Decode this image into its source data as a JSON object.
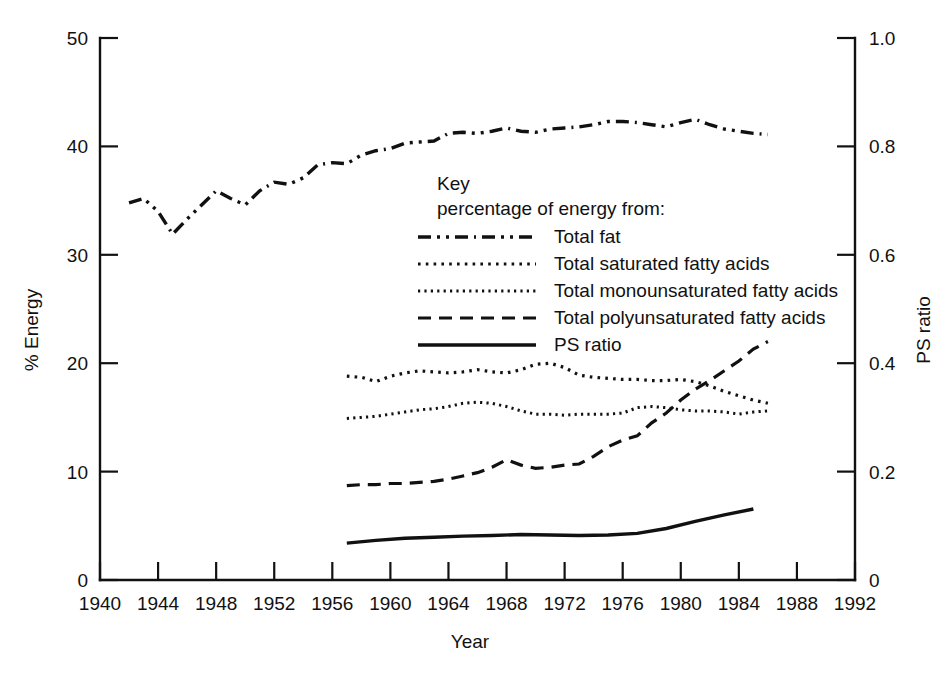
{
  "chart_data": {
    "type": "line",
    "title": "",
    "xlabel": "Year",
    "ylabel": "% Energy",
    "y2label": "PS ratio",
    "xlim": [
      1940,
      1992
    ],
    "ylim": [
      0,
      50
    ],
    "y2lim": [
      0,
      1.0
    ],
    "xticks": [
      1940,
      1944,
      1948,
      1952,
      1956,
      1960,
      1964,
      1968,
      1972,
      1976,
      1980,
      1984,
      1988,
      1992
    ],
    "xtick_labels": [
      "1940",
      "1944",
      "1948",
      "1952",
      "1956",
      "1960",
      "1964",
      "1968",
      "1972",
      "1976",
      "1980",
      "1984",
      "1988",
      "1992"
    ],
    "yticks": [
      0,
      10,
      20,
      30,
      40,
      50
    ],
    "ytick_labels": [
      "0",
      "10",
      "20",
      "30",
      "40",
      "50"
    ],
    "y2ticks": [
      0,
      0.2,
      0.4,
      0.6,
      0.8,
      1.0
    ],
    "y2tick_labels": [
      "0",
      "0.2",
      "0.4",
      "0.6",
      "0.8",
      "1.0"
    ],
    "grid": false,
    "legend_position": "center",
    "legend_title": "Key",
    "legend_subtitle": "percentage of energy from:",
    "series": [
      {
        "name": "Total fat",
        "axis": "left",
        "dash": "dashdotdot",
        "x": [
          1942,
          1943,
          1944,
          1945,
          1946,
          1947,
          1948,
          1949,
          1950,
          1951,
          1952,
          1953,
          1954,
          1955,
          1956,
          1957,
          1958,
          1959,
          1960,
          1961,
          1962,
          1963,
          1964,
          1965,
          1966,
          1967,
          1968,
          1969,
          1970,
          1971,
          1972,
          1973,
          1974,
          1975,
          1976,
          1977,
          1978,
          1979,
          1980,
          1981,
          1982,
          1983,
          1984,
          1985,
          1986
        ],
        "y": [
          34.8,
          35.2,
          34.0,
          31.9,
          33.3,
          34.6,
          35.9,
          35.2,
          34.6,
          35.9,
          36.7,
          36.5,
          37.1,
          38.3,
          38.5,
          38.4,
          39.2,
          39.6,
          39.8,
          40.3,
          40.4,
          40.5,
          41.2,
          41.3,
          41.2,
          41.4,
          41.7,
          41.4,
          41.3,
          41.6,
          41.7,
          41.8,
          42.0,
          42.3,
          42.3,
          42.2,
          42.0,
          41.8,
          42.2,
          42.5,
          42.0,
          41.6,
          41.4,
          41.2,
          41.1
        ]
      },
      {
        "name": "Total saturated fatty acids",
        "axis": "left",
        "dash": "dotted",
        "x": [
          1957,
          1958,
          1959,
          1960,
          1961,
          1962,
          1963,
          1964,
          1965,
          1966,
          1967,
          1968,
          1969,
          1970,
          1971,
          1972,
          1973,
          1974,
          1975,
          1976,
          1977,
          1978,
          1979,
          1980,
          1981,
          1982,
          1983,
          1984,
          1985,
          1986
        ],
        "y": [
          18.8,
          18.7,
          18.3,
          18.8,
          19.1,
          19.3,
          19.2,
          19.1,
          19.2,
          19.4,
          19.2,
          19.1,
          19.4,
          19.9,
          20.0,
          19.6,
          18.9,
          18.7,
          18.6,
          18.5,
          18.5,
          18.4,
          18.4,
          18.5,
          18.3,
          17.9,
          17.4,
          17.0,
          16.6,
          16.3
        ]
      },
      {
        "name": "Total monounsaturated fatty acids",
        "axis": "left",
        "dash": "fine-dotted",
        "x": [
          1957,
          1958,
          1959,
          1960,
          1961,
          1962,
          1963,
          1964,
          1965,
          1966,
          1967,
          1968,
          1969,
          1970,
          1971,
          1972,
          1973,
          1974,
          1975,
          1976,
          1977,
          1978,
          1979,
          1980,
          1981,
          1982,
          1983,
          1984,
          1985,
          1986
        ],
        "y": [
          14.9,
          15.0,
          15.1,
          15.3,
          15.5,
          15.7,
          15.8,
          16.0,
          16.3,
          16.4,
          16.3,
          16.0,
          15.6,
          15.3,
          15.3,
          15.2,
          15.3,
          15.3,
          15.3,
          15.4,
          15.9,
          16.0,
          15.9,
          15.7,
          15.6,
          15.6,
          15.5,
          15.3,
          15.5,
          15.6
        ]
      },
      {
        "name": "Total polyunsaturated fatty acids",
        "axis": "left",
        "dash": "dashed",
        "x": [
          1957,
          1958,
          1959,
          1960,
          1961,
          1962,
          1963,
          1964,
          1965,
          1966,
          1967,
          1968,
          1969,
          1970,
          1971,
          1972,
          1973,
          1974,
          1975,
          1976,
          1977,
          1978,
          1979,
          1980,
          1981,
          1982,
          1983,
          1984,
          1985,
          1986
        ],
        "y": [
          8.7,
          8.8,
          8.8,
          8.9,
          8.9,
          9.0,
          9.1,
          9.3,
          9.6,
          9.9,
          10.4,
          11.1,
          10.6,
          10.3,
          10.4,
          10.6,
          10.7,
          11.4,
          12.3,
          12.9,
          13.3,
          14.5,
          15.4,
          16.6,
          17.6,
          18.4,
          19.3,
          20.2,
          21.3,
          22.0
        ]
      },
      {
        "name": "PS ratio",
        "axis": "right",
        "dash": "solid",
        "x": [
          1957,
          1959,
          1961,
          1963,
          1965,
          1967,
          1969,
          1971,
          1973,
          1975,
          1977,
          1979,
          1981,
          1983,
          1985
        ],
        "y": [
          0.068,
          0.073,
          0.077,
          0.079,
          0.081,
          0.082,
          0.084,
          0.083,
          0.082,
          0.083,
          0.086,
          0.095,
          0.108,
          0.12,
          0.131
        ]
      }
    ]
  },
  "legend": {
    "title": "Key",
    "subtitle": "percentage of energy from:",
    "entries": [
      {
        "label": "Total fat",
        "dash": "dashdotdot"
      },
      {
        "label": "Total saturated fatty acids",
        "dash": "dotted"
      },
      {
        "label": "Total monounsaturated fatty acids",
        "dash": "fine-dotted"
      },
      {
        "label": "Total polyunsaturated fatty acids",
        "dash": "dashed"
      },
      {
        "label": "PS ratio",
        "dash": "solid"
      }
    ]
  },
  "axes": {
    "left_title": "% Energy",
    "right_title": "PS ratio",
    "bottom_title": "Year"
  },
  "colors": {
    "ink": "#111111",
    "background": "#ffffff"
  }
}
